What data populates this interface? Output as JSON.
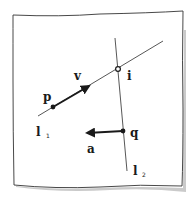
{
  "diagram": {
    "type": "hand-drawn geometry sketch",
    "colors": {
      "ink": "#1a1a1a",
      "paper": "#ffffff",
      "shadow": "#bdbdbd",
      "line": "#444444"
    },
    "lines": [
      {
        "id": "l1",
        "label": "l",
        "subscript": "1"
      },
      {
        "id": "l2",
        "label": "l",
        "subscript": "2"
      }
    ],
    "points": [
      {
        "id": "p",
        "label": "p",
        "style": "filled"
      },
      {
        "id": "q",
        "label": "q",
        "style": "filled"
      },
      {
        "id": "i",
        "label": "i",
        "style": "open",
        "description": "intersection of l1 and l2"
      }
    ],
    "vectors": [
      {
        "id": "v",
        "label": "v",
        "from": "p",
        "direction": "along l1"
      },
      {
        "id": "a",
        "label": "a",
        "from": "q",
        "direction": "left"
      }
    ]
  }
}
